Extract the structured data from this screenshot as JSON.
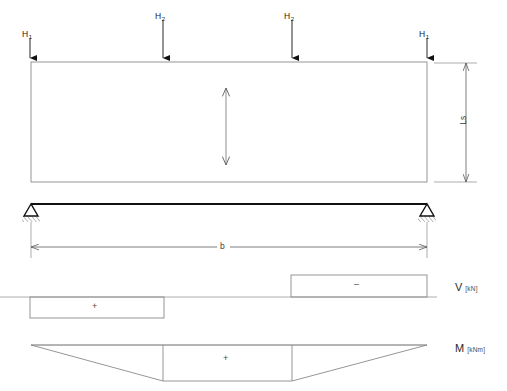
{
  "figure": {
    "colors": {
      "outline": "#6e6e6e",
      "beam": "#111111",
      "arrow": "#111111",
      "dimension": "#6e6e6e",
      "background": "#ffffff",
      "text": "#1a1a1a"
    }
  },
  "loads": [
    {
      "id": "load-h1-left",
      "symbol": "H",
      "subscript": "1",
      "x": 30,
      "label_x": 22,
      "label_y": 30,
      "arrow_top": 38,
      "arrow_bottom": 58
    },
    {
      "id": "load-h2-mid-left",
      "symbol": "H",
      "subscript": "2",
      "x": 163,
      "label_x": 155,
      "label_y": 12,
      "arrow_top": 20,
      "arrow_bottom": 58
    },
    {
      "id": "load-h2-mid-right",
      "symbol": "H",
      "subscript": "2",
      "x": 292,
      "label_x": 284,
      "label_y": 12,
      "arrow_top": 20,
      "arrow_bottom": 58
    },
    {
      "id": "load-h1-right",
      "symbol": "H",
      "subscript": "1",
      "x": 427,
      "label_x": 419,
      "label_y": 30,
      "arrow_top": 38,
      "arrow_bottom": 58
    }
  ],
  "dimensions": {
    "height": {
      "name": "Ls",
      "label": "Ls",
      "orientation": "vertical",
      "label_x": 466,
      "label_y": 120
    },
    "span": {
      "name": "b",
      "label": "b",
      "orientation": "horizontal",
      "label_x": 222,
      "label_y": 243
    }
  },
  "diagrams": {
    "shear": {
      "name": "shear-force-diagram",
      "axis_label": "V",
      "unit": "[kN]",
      "label_x": 455,
      "label_y": 286,
      "baseline_y": 297,
      "segments": [
        {
          "sign": "+",
          "label": "+",
          "x_start": 30,
          "x_end": 164,
          "y_top": 297,
          "y_bottom": 318,
          "label_x": 94,
          "label_y": 304
        },
        {
          "sign": "-",
          "label": "–",
          "x_start": 291,
          "x_end": 427,
          "y_top": 275,
          "y_bottom": 297,
          "label_x": 356,
          "label_y": 283
        }
      ]
    },
    "moment": {
      "name": "bending-moment-diagram",
      "axis_label": "M",
      "unit": "[kNm]",
      "label_x": 455,
      "label_y": 347,
      "baseline_y": 345,
      "sign": "+",
      "sign_label": "+",
      "sign_label_x": 225,
      "sign_label_y": 358,
      "polygon": "31,345 163,381 292,381 427,345"
    }
  },
  "beam": {
    "name": "beam-member",
    "x_start": 31,
    "x_end": 427,
    "y": 204,
    "section_rect": {
      "x": 31,
      "y": 62,
      "width": 396,
      "height": 120
    },
    "inner_arrow": {
      "x": 226,
      "y_top": 88,
      "y_bottom": 165
    }
  },
  "supports": [
    {
      "id": "support-left",
      "type": "hinged",
      "x": 31,
      "y": 204
    },
    {
      "id": "support-right",
      "type": "hinged",
      "x": 427,
      "y": 204
    }
  ]
}
